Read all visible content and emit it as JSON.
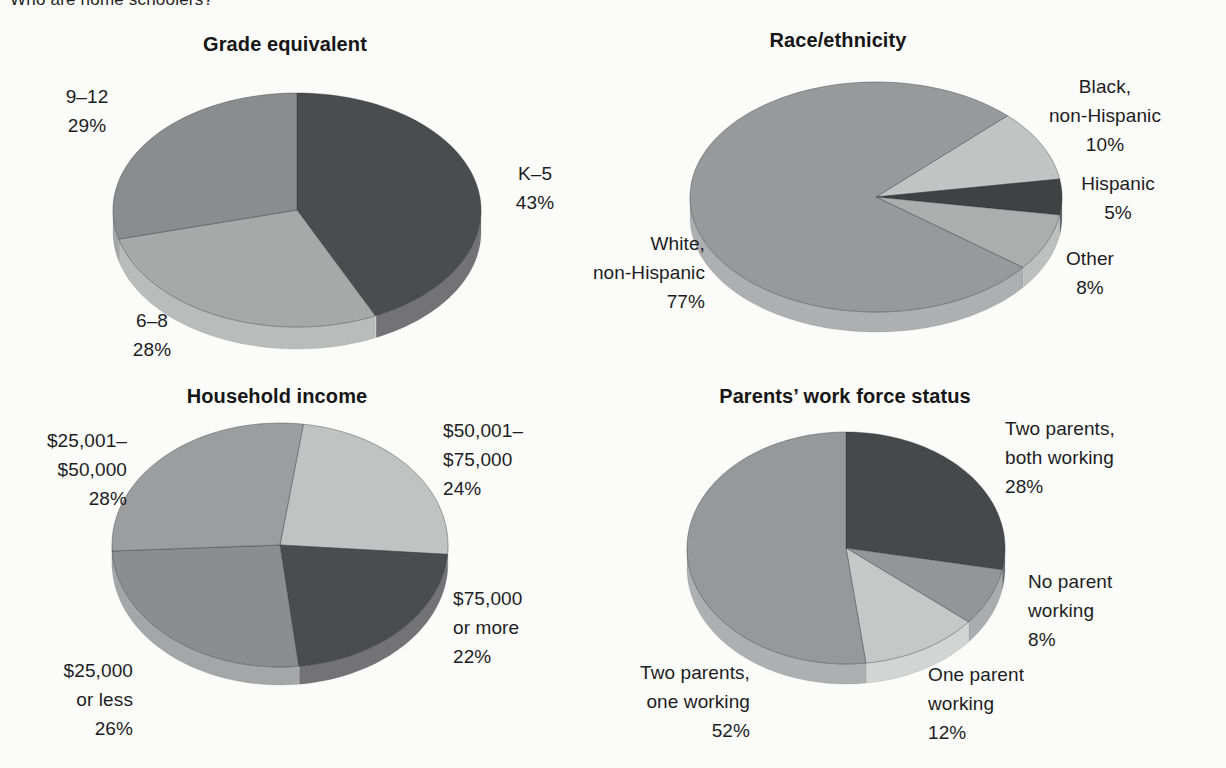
{
  "page": {
    "heading_top_clipped": "Who are home schoolers?"
  },
  "chart_data": [
    {
      "type": "pie",
      "title": "Grade equivalent",
      "unit": "percent",
      "legend_position": "around-slices",
      "slices": [
        {
          "label": "K–5",
          "value": 43,
          "color": "#4b4c50"
        },
        {
          "label": "6–8",
          "value": 28,
          "color": "#a7a9a9"
        },
        {
          "label": "9–12",
          "value": 29,
          "color": "#8a8c8e"
        }
      ],
      "callouts": [
        {
          "lines": [
            "K–5",
            "43%"
          ]
        },
        {
          "lines": [
            "6–8",
            "28%"
          ]
        },
        {
          "lines": [
            "9–12",
            "29%"
          ]
        }
      ]
    },
    {
      "type": "pie",
      "title": "Race/ethnicity",
      "unit": "percent",
      "legend_position": "around-slices",
      "slices": [
        {
          "label": "Black, non-Hispanic",
          "value": 10,
          "color": "#c2c4c4"
        },
        {
          "label": "Hispanic",
          "value": 5,
          "color": "#404145"
        },
        {
          "label": "Other",
          "value": 8,
          "color": "#acaeae"
        },
        {
          "label": "White, non-Hispanic",
          "value": 77,
          "color": "#97999b"
        }
      ],
      "callouts": [
        {
          "lines": [
            "Black,",
            "non-Hispanic",
            "10%"
          ]
        },
        {
          "lines": [
            "Hispanic",
            "5%"
          ]
        },
        {
          "lines": [
            "Other",
            "8%"
          ]
        },
        {
          "lines": [
            "White,",
            "non-Hispanic",
            "77%"
          ]
        }
      ]
    },
    {
      "type": "pie",
      "title": "Household income",
      "unit": "percent",
      "legend_position": "around-slices",
      "slices": [
        {
          "label": "$50,001–$75,000",
          "value": 24,
          "color": "#c1c3c3"
        },
        {
          "label": "$75,000 or more",
          "value": 22,
          "color": "#4b4c50"
        },
        {
          "label": "$25,000 or less",
          "value": 26,
          "color": "#8b8d8f"
        },
        {
          "label": "$25,001–$50,000",
          "value": 28,
          "color": "#9b9d9f"
        }
      ],
      "callouts": [
        {
          "lines": [
            "$50,001–",
            "$75,000",
            "24%"
          ]
        },
        {
          "lines": [
            "$75,000",
            "or more",
            "22%"
          ]
        },
        {
          "lines": [
            "$25,000",
            "or less",
            "26%"
          ]
        },
        {
          "lines": [
            "$25,001–",
            "$50,000",
            "28%"
          ]
        }
      ]
    },
    {
      "type": "pie",
      "title": "Parents’ work force status",
      "unit": "percent",
      "legend_position": "around-slices",
      "slices": [
        {
          "label": "Two parents, both working",
          "value": 28,
          "color": "#47484c"
        },
        {
          "label": "No parent working",
          "value": 8,
          "color": "#939597"
        },
        {
          "label": "One parent working",
          "value": 12,
          "color": "#c6c8c8"
        },
        {
          "label": "Two parents, one working",
          "value": 52,
          "color": "#96989a"
        }
      ],
      "callouts": [
        {
          "lines": [
            "Two parents,",
            "both working",
            "28%"
          ]
        },
        {
          "lines": [
            "No parent",
            "working",
            "8%"
          ]
        },
        {
          "lines": [
            "One parent",
            "working",
            "12%"
          ]
        },
        {
          "lines": [
            "Two parents,",
            "one working",
            "52%"
          ]
        }
      ]
    }
  ]
}
